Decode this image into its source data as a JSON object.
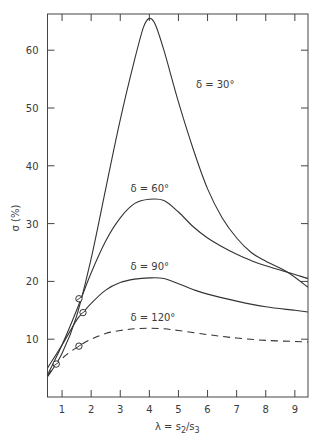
{
  "chart_data": {
    "type": "line",
    "title": "",
    "xlabel": "λ = s2/s3",
    "ylabel": "σ (%)",
    "xlim": [
      0.5,
      9.45
    ],
    "ylim": [
      0,
      66
    ],
    "grid": false,
    "legend": "inline curve labels",
    "x_ticks": [
      1,
      2,
      3,
      4,
      5,
      6,
      7,
      8,
      9
    ],
    "y_ticks": [
      10,
      20,
      30,
      40,
      50,
      60
    ],
    "series": [
      {
        "name": "δ = 30°",
        "style": "solid",
        "points": [
          [
            0.5,
            3.5
          ],
          [
            1.0,
            7.5
          ],
          [
            1.5,
            14
          ],
          [
            2.0,
            24
          ],
          [
            2.5,
            36
          ],
          [
            3.0,
            48
          ],
          [
            3.5,
            58.5
          ],
          [
            3.8,
            64
          ],
          [
            4.0,
            65.5
          ],
          [
            4.2,
            64.5
          ],
          [
            4.5,
            60
          ],
          [
            5.0,
            51
          ],
          [
            5.5,
            43
          ],
          [
            6.0,
            36
          ],
          [
            6.5,
            31
          ],
          [
            7.0,
            27.5
          ],
          [
            7.5,
            25
          ],
          [
            8.0,
            23.5
          ],
          [
            8.75,
            21.6
          ],
          [
            9.45,
            19
          ]
        ]
      },
      {
        "name": "δ = 60°",
        "style": "solid",
        "points": [
          [
            0.5,
            3.8
          ],
          [
            1.0,
            9
          ],
          [
            1.5,
            15
          ],
          [
            2.0,
            21.5
          ],
          [
            2.5,
            27
          ],
          [
            3.0,
            31
          ],
          [
            3.5,
            33.5
          ],
          [
            4.0,
            34.2
          ],
          [
            4.5,
            34
          ],
          [
            5.0,
            32
          ],
          [
            5.5,
            29.5
          ],
          [
            6.0,
            27.5
          ],
          [
            6.5,
            26
          ],
          [
            7.0,
            24.7
          ],
          [
            7.5,
            23.6
          ],
          [
            8.0,
            22.7
          ],
          [
            8.75,
            21.6
          ],
          [
            9.45,
            20.5
          ]
        ]
      },
      {
        "name": "δ = 90°",
        "style": "solid",
        "points": [
          [
            0.5,
            5
          ],
          [
            1.0,
            9
          ],
          [
            1.5,
            13.3
          ],
          [
            1.72,
            14.6
          ],
          [
            2.0,
            16.2
          ],
          [
            2.5,
            18.5
          ],
          [
            3.0,
            19.8
          ],
          [
            3.5,
            20.4
          ],
          [
            4.0,
            20.6
          ],
          [
            4.5,
            20.5
          ],
          [
            5.0,
            19.6
          ],
          [
            5.5,
            18.6
          ],
          [
            6.0,
            17.8
          ],
          [
            7.0,
            16.6
          ],
          [
            8.0,
            15.6
          ],
          [
            9.0,
            15
          ],
          [
            9.45,
            14.7
          ]
        ]
      },
      {
        "name": "δ = 120°",
        "style": "dashed",
        "points": [
          [
            0.5,
            3.6
          ],
          [
            0.8,
            5.7
          ],
          [
            1.2,
            7.5
          ],
          [
            1.58,
            8.8
          ],
          [
            2.0,
            10
          ],
          [
            2.5,
            11
          ],
          [
            3.0,
            11.5
          ],
          [
            3.5,
            11.8
          ],
          [
            4.0,
            11.9
          ],
          [
            4.5,
            11.8
          ],
          [
            5.0,
            11.5
          ],
          [
            6.0,
            10.8
          ],
          [
            7.0,
            10.2
          ],
          [
            8.0,
            9.8
          ],
          [
            9.0,
            9.6
          ],
          [
            9.45,
            9.5
          ]
        ]
      }
    ],
    "markers": [
      {
        "shape": "circle-slash",
        "x": 0.8,
        "y": 5.7
      },
      {
        "shape": "circle-slash",
        "x": 1.58,
        "y": 17.0
      },
      {
        "shape": "circle-slash",
        "x": 1.72,
        "y": 14.6
      },
      {
        "shape": "circle-slash",
        "x": 1.58,
        "y": 8.8
      }
    ],
    "annotations": [
      {
        "text": "δ = 30°",
        "x": 5.6,
        "y": 53.5
      },
      {
        "text": "δ = 60°",
        "x": 3.35,
        "y": 35.5
      },
      {
        "text": "δ = 90°",
        "x": 3.35,
        "y": 22
      },
      {
        "text": "δ = 120°",
        "x": 3.35,
        "y": 13.2
      }
    ]
  },
  "axes": {
    "y_label": "σ (%)",
    "x_label_prefix": "λ = s",
    "x_label_sub1": "2",
    "x_label_mid": "/s",
    "x_label_sub2": "3"
  },
  "style": {
    "line_color": "#333333",
    "axis_color": "#444444",
    "background": "#ffffff"
  }
}
